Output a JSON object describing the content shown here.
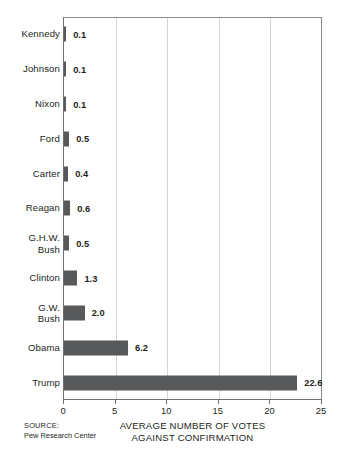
{
  "chart_data": {
    "type": "bar",
    "orientation": "horizontal",
    "title": "",
    "xlabel_line1": "AVERAGE NUMBER OF VOTES",
    "xlabel_line2": "AGAINST CONFIRMATION",
    "ylabel": "",
    "xlim": [
      0,
      25
    ],
    "xticks": [
      0,
      5,
      10,
      15,
      20,
      25
    ],
    "xtick_labels": [
      "0",
      "5",
      "10",
      "15",
      "20",
      "25"
    ],
    "grid": "vertical",
    "legend": "none",
    "bar_color": "#58595b",
    "categories": [
      "Kennedy",
      "Johnson",
      "Nixon",
      "Ford",
      "Carter",
      "Reagan",
      "G.H.W.\nBush",
      "Clinton",
      "G.W.\nBush",
      "Obama",
      "Trump"
    ],
    "values": [
      0.1,
      0.1,
      0.1,
      0.5,
      0.4,
      0.6,
      0.5,
      1.3,
      2.0,
      6.2,
      22.6
    ],
    "value_labels": [
      "0.1",
      "0.1",
      "0.1",
      "0.5",
      "0.4",
      "0.6",
      "0.5",
      "1.3",
      "2.0",
      "6.2",
      "22.6"
    ]
  },
  "footer": {
    "source_label": "SOURCE:",
    "source_name": "Pew Research Center"
  }
}
